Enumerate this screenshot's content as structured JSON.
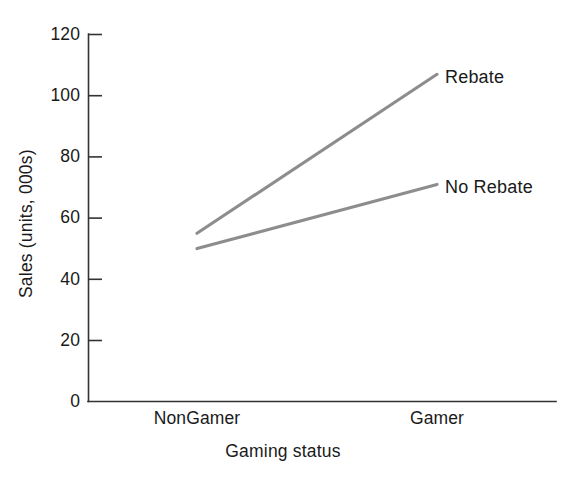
{
  "figure": {
    "width": 563,
    "height": 481,
    "background": "#ffffff"
  },
  "chart_data": {
    "type": "line",
    "title": "",
    "subtitle": "",
    "xlabel": "Gaming status",
    "ylabel": "Sales (units, 000s)",
    "categories": [
      "NonGamer",
      "Gamer"
    ],
    "series": [
      {
        "name": "Rebate",
        "values": [
          55,
          107
        ],
        "color": "#8d8d8d"
      },
      {
        "name": "No Rebate",
        "values": [
          50,
          71
        ],
        "color": "#8d8d8d"
      }
    ],
    "ylim": [
      0,
      120
    ],
    "yticks": [
      0,
      20,
      40,
      60,
      80,
      100,
      120
    ],
    "ytick_labels": [
      "0",
      "20",
      "40",
      "60",
      "80",
      "100",
      "120"
    ],
    "xtick_labels": [
      "NonGamer",
      "Gamer"
    ],
    "grid": false,
    "legend_position": "inline-right-of-line-ends",
    "annotations": [
      {
        "text": "Rebate",
        "attached_to": "Rebate",
        "at_category": "Gamer",
        "at_value": 107
      },
      {
        "text": "No Rebate",
        "attached_to": "No Rebate",
        "at_category": "Gamer",
        "at_value": 71
      }
    ],
    "axis_color": "#333333",
    "tick_direction": "in",
    "line_color": "#8d8d8d"
  },
  "labels": {
    "y_axis_title": "Sales (units, 000s)",
    "x_axis_title": "Gaming status",
    "y_ticks": [
      "120",
      "100",
      "80",
      "60",
      "40",
      "20",
      "0"
    ],
    "x_ticks": [
      "NonGamer",
      "Gamer"
    ],
    "series": [
      "Rebate",
      "No Rebate"
    ]
  }
}
